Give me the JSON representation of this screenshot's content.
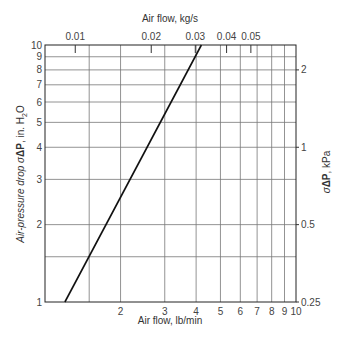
{
  "chart_data": {
    "type": "line",
    "title": "",
    "scale": "log-log",
    "xlabel": "Air flow, lb/min",
    "x2label": "Air flow, kg/s",
    "ylabel": "Air-pressure drop σΔP, in. H₂O",
    "ylabel_parts": {
      "main": "Air-pressure drop σ",
      "delta": "ΔP",
      "rest": ", in. H",
      "sub": "2",
      "end": "O"
    },
    "y2label": "σΔP, kPa",
    "y2label_parts": {
      "sigma": "σ",
      "delta": "ΔP",
      "rest": ", kPa"
    },
    "xlim": [
      1,
      10
    ],
    "ylim": [
      1,
      10
    ],
    "grid": true,
    "x_ticks": [
      {
        "value": 2,
        "label": "2"
      },
      {
        "value": 3,
        "label": "3"
      },
      {
        "value": 4,
        "label": "4"
      },
      {
        "value": 5,
        "label": "5"
      },
      {
        "value": 6,
        "label": "6"
      },
      {
        "value": 7,
        "label": "7"
      },
      {
        "value": 8,
        "label": "8"
      },
      {
        "value": 9,
        "label": "9"
      },
      {
        "value": 10,
        "label": "10"
      }
    ],
    "x_gridlines": [
      1.5,
      2,
      3,
      4,
      5,
      6,
      7,
      8,
      9
    ],
    "y_ticks": [
      {
        "value": 1,
        "label": "1"
      },
      {
        "value": 2,
        "label": "2"
      },
      {
        "value": 3,
        "label": "3"
      },
      {
        "value": 4,
        "label": "4"
      },
      {
        "value": 5,
        "label": "5"
      },
      {
        "value": 6,
        "label": "6"
      },
      {
        "value": 7,
        "label": "7"
      },
      {
        "value": 8,
        "label": "8"
      },
      {
        "value": 9,
        "label": "9"
      },
      {
        "value": 10,
        "label": "10"
      }
    ],
    "y_gridlines": [
      1.5,
      2,
      3,
      4,
      5,
      6,
      7,
      8,
      9
    ],
    "x2_ticks": [
      {
        "value": 1.32,
        "label": "0.01"
      },
      {
        "value": 2.65,
        "label": "0.02"
      },
      {
        "value": 3.97,
        "label": "0.03"
      },
      {
        "value": 5.29,
        "label": "0.04"
      },
      {
        "value": 6.61,
        "label": "0.05"
      }
    ],
    "y2_ticks": [
      {
        "value": 1,
        "label": "0.25"
      },
      {
        "value": 2,
        "label": "0.5"
      },
      {
        "value": 4,
        "label": "1"
      },
      {
        "value": 8,
        "label": "2"
      }
    ],
    "series": [
      {
        "name": "pressure drop",
        "color": "#111111",
        "x": [
          1.2,
          4.2
        ],
        "y": [
          1,
          10
        ]
      }
    ]
  }
}
